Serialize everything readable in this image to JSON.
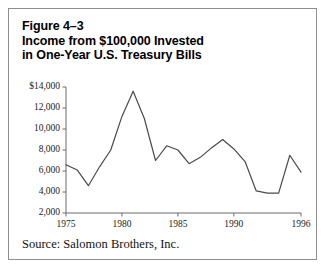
{
  "figure": {
    "title_lines": [
      "Figure 4–3",
      "Income from $100,000 Invested",
      "in One-Year U.S. Treasury Bills"
    ],
    "source": "Source: Salomon Brothers, Inc.",
    "border_color": "#8e8e8e",
    "line_color": "#4a4a4a",
    "axis_color": "#6b6b6b",
    "background": "#ffffff"
  },
  "chart_data": {
    "type": "line",
    "title": "Income from $100,000 Invested in One-Year U.S. Treasury Bills",
    "xlabel": "",
    "ylabel": "",
    "ylim": [
      2000,
      14000
    ],
    "xlim": [
      1975,
      1996
    ],
    "grid": false,
    "legend": null,
    "ytick_labels": [
      "$14,000",
      "12,000",
      "10,000",
      "8,000",
      "6,000",
      "4,000",
      "2,000"
    ],
    "ytick_values": [
      14000,
      12000,
      10000,
      8000,
      6000,
      4000,
      2000
    ],
    "xtick_labels": [
      "1975",
      "1980",
      "1985",
      "1990",
      "1996"
    ],
    "xtick_values": [
      1975,
      1980,
      1985,
      1990,
      1996
    ],
    "x": [
      1975,
      1976,
      1977,
      1978,
      1979,
      1980,
      1981,
      1982,
      1983,
      1984,
      1985,
      1986,
      1987,
      1988,
      1989,
      1990,
      1991,
      1992,
      1993,
      1994,
      1995,
      1996
    ],
    "values": [
      6600,
      6100,
      4600,
      6400,
      8000,
      11200,
      13600,
      11000,
      7000,
      8400,
      8000,
      6700,
      7300,
      8200,
      9000,
      8100,
      6900,
      4100,
      3900,
      3900,
      7500,
      5900
    ],
    "series": [
      {
        "name": "Income from $100,000 in one-year U.S. Treasury bills",
        "values": [
          6600,
          6100,
          4600,
          6400,
          8000,
          11200,
          13600,
          11000,
          7000,
          8400,
          8000,
          6700,
          7300,
          8200,
          9000,
          8100,
          6900,
          4100,
          3900,
          3900,
          7500,
          5900
        ]
      }
    ]
  }
}
